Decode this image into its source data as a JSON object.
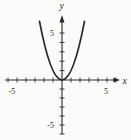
{
  "figure": {
    "background": "#fbfbf9",
    "ink_color": "#2a2a2a"
  },
  "chart_data": {
    "type": "line",
    "title": "",
    "xlabel": "x",
    "ylabel": "y",
    "xlim": [
      -6.5,
      6.5
    ],
    "ylim": [
      -6.5,
      7
    ],
    "grid": false,
    "legend": false,
    "x_tick_step": 1,
    "y_tick_step": 1,
    "x_labeled_ticks": [
      {
        "value": -5,
        "label": "-5"
      },
      {
        "value": 5,
        "label": "5"
      }
    ],
    "y_labeled_ticks": [
      {
        "value": 5,
        "label": "5"
      },
      {
        "value": -5,
        "label": "-5"
      }
    ],
    "series": [
      {
        "name": "parabola",
        "function": "y = x^2",
        "x": [
          -2.5,
          -2,
          -1.5,
          -1,
          -0.5,
          0,
          0.5,
          1,
          1.5,
          2,
          2.5
        ],
        "y": [
          6.25,
          4,
          2.25,
          1,
          0.25,
          0,
          0.25,
          1,
          2.25,
          4,
          6.25
        ]
      }
    ]
  }
}
